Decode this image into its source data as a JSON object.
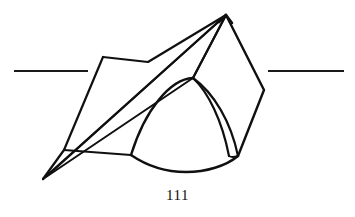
{
  "figure": {
    "caption": "111",
    "background_color": "#ffffff",
    "ink_color": "#101010",
    "axis_color": "#1a1a1a",
    "stroke_width": 2.2,
    "thin_stroke_width": 1.8,
    "axis_stroke_width": 2.2,
    "apex_label": "apex",
    "elements": {
      "left_axis_line": {
        "x1": 14,
        "y1": 71,
        "x2": 88,
        "y2": 71,
        "fade": "left"
      },
      "right_axis_line": {
        "x1": 268,
        "y1": 71,
        "x2": 344,
        "y2": 71,
        "fade": "right"
      },
      "apex_point": {
        "x": 226,
        "y": 15
      },
      "bottom_left_point": {
        "x": 43,
        "y": 179
      },
      "dome_top_point": {
        "x": 193,
        "y": 78
      },
      "left_quad": {
        "points": "103,57 148,62 226,15 64,150",
        "description": "left quadrilateral flap"
      },
      "right_diamond": {
        "points": "226,15 264,90 238,155 193,78",
        "description": "right diamond face"
      },
      "dome": {
        "left_base": {
          "x": 131,
          "y": 155
        },
        "right_base": {
          "x": 238,
          "y": 156
        },
        "bottom_low": {
          "x": 186,
          "y": 172
        },
        "description": "curved dome / spherical cap"
      },
      "crescent": {
        "description": "narrow crescent sliver on right of dome"
      },
      "cone_edges": {
        "count": 3,
        "description": "three near-parallel ruling lines from bottom-left point to apex region"
      }
    }
  }
}
